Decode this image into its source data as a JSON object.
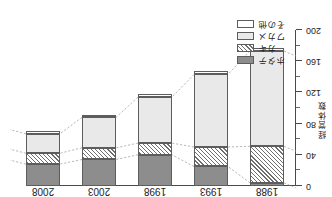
{
  "chart_data": {
    "type": "bar",
    "subtype": "stacked-column",
    "title": "",
    "xlabel": "年",
    "ylabel": "経営体数",
    "categories": [
      "1988",
      "1993",
      "1998",
      "2003",
      "2008"
    ],
    "ylim": [
      0,
      200
    ],
    "y_inverted": true,
    "y_ticks": [
      "0",
      "40",
      "80",
      "120",
      "160",
      "200"
    ],
    "y_tick_values": [
      0,
      40,
      80,
      120,
      160,
      200
    ],
    "y_minor_step": 20,
    "grid": false,
    "legend_position": "bottom-left",
    "rotated_180": true,
    "series": [
      {
        "name": "その他",
        "key": "other",
        "color": "#ffffff",
        "pattern": "solid",
        "values": [
          4,
          5,
          4,
          3,
          3
        ]
      },
      {
        "name": "ワカメ",
        "key": "wakame",
        "color": "#e9e9e9",
        "pattern": "solid",
        "values": [
          122,
          93,
          59,
          39,
          25
        ]
      },
      {
        "name": "カキ",
        "key": "kaki",
        "color": "#ffffff",
        "pattern": "hatch",
        "values": [
          47,
          25,
          15,
          15,
          14
        ]
      },
      {
        "name": "ホタテ",
        "key": "hotate",
        "color": "#8d8d8d",
        "pattern": "solid",
        "values": [
          4,
          25,
          40,
          34,
          28
        ]
      }
    ],
    "totals": [
      177,
      148,
      118,
      91,
      70
    ],
    "stack_order_from_zero": [
      "ホタテ",
      "カキ",
      "ワカメ",
      "その他"
    ],
    "connectors": true
  },
  "axis": {
    "x_title": "年",
    "y_title_chars": [
      "経",
      "営",
      "体",
      "数"
    ],
    "ticks": [
      {
        "label": "0",
        "value": 0
      },
      {
        "label": "40",
        "value": 40
      },
      {
        "label": "80",
        "value": 80
      },
      {
        "label": "120",
        "value": 120
      },
      {
        "label": "160",
        "value": 160
      },
      {
        "label": "200",
        "value": 200
      }
    ]
  },
  "legend": {
    "items": [
      {
        "label": "ホタテ",
        "swatch": "dark"
      },
      {
        "label": "カキ",
        "swatch": "hatch"
      },
      {
        "label": "ワカメ",
        "swatch": "light"
      },
      {
        "label": "その他",
        "swatch": "white"
      }
    ]
  }
}
